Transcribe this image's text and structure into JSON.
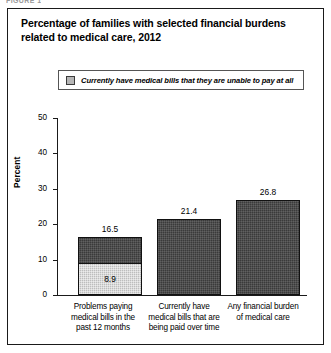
{
  "figure_caption": "FIGURE 1",
  "chart_data": {
    "type": "bar",
    "title": "Percentage of families with selected financial burdens related to medical care, 2012",
    "title_line1": "Percentage of families with selected financial burdens",
    "title_line2": "related to medical care, 2012",
    "xlabel": "",
    "ylabel": "Percent",
    "ylim": [
      0,
      50
    ],
    "ytick_labels": [
      "0",
      "10",
      "20",
      "30",
      "40",
      "50"
    ],
    "yticks": [
      0,
      10,
      20,
      30,
      40,
      50
    ],
    "grid": false,
    "legend_position": "top",
    "legend": [
      {
        "label": "Currently have medical bills that they are unable to pay at all",
        "color": "#bdbdbd"
      }
    ],
    "series": [
      {
        "name": "Total",
        "color": "#3a3a3a",
        "values": [
          16.5,
          21.4,
          26.8
        ]
      },
      {
        "name": "Currently have medical bills that they are unable to pay at all",
        "color": "#bdbdbd",
        "values": [
          8.9,
          null,
          null
        ]
      }
    ],
    "categories": [
      "Problems paying medical bills in the past 12 months",
      "Currently have medical bills that are being paid over time",
      "Any financial burden of medical care"
    ],
    "category_lines": [
      [
        "Problems paying",
        "medical bills in the",
        "past 12 months"
      ],
      [
        "Currently have",
        "medical bills that are",
        "being paid over time"
      ],
      [
        "Any financial burden",
        "of medical care"
      ]
    ],
    "data_labels": {
      "totals": [
        "16.5",
        "21.4",
        "26.8"
      ],
      "sub": [
        "8.9",
        "",
        ""
      ]
    }
  }
}
